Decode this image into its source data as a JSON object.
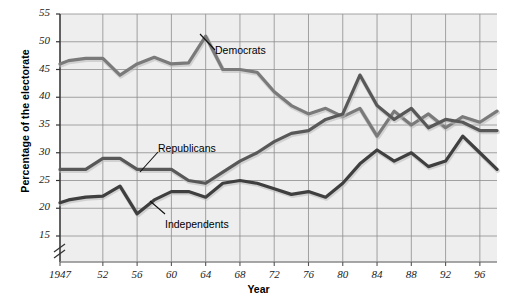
{
  "chart_data": {
    "type": "line",
    "title": "",
    "xlabel": "Year",
    "ylabel": "Percentage of the electorate",
    "xlim": [
      1947,
      1998
    ],
    "ylim": [
      13,
      55
    ],
    "axis_break": true,
    "grid": true,
    "legend_position": "inline-annotations",
    "ytick_labels": [
      "15",
      "20",
      "25",
      "30",
      "35",
      "40",
      "45",
      "50",
      "55"
    ],
    "ytick_values": [
      15,
      20,
      25,
      30,
      35,
      40,
      45,
      50,
      55
    ],
    "xtick_labels": [
      "1947",
      "52",
      "56",
      "60",
      "64",
      "68",
      "72",
      "76",
      "80",
      "84",
      "88",
      "92",
      "96"
    ],
    "xtick_values": [
      1947,
      1952,
      1956,
      1960,
      1964,
      1968,
      1972,
      1976,
      1980,
      1984,
      1988,
      1992,
      1996
    ],
    "x": [
      1947,
      1948,
      1950,
      1952,
      1954,
      1956,
      1958,
      1960,
      1962,
      1964,
      1966,
      1968,
      1970,
      1972,
      1974,
      1976,
      1978,
      1980,
      1982,
      1984,
      1986,
      1988,
      1990,
      1992,
      1994,
      1996,
      1998
    ],
    "series": [
      {
        "name": "Democrats",
        "color": "#7a7a7a",
        "values": [
          46.0,
          46.6,
          47.0,
          47.0,
          44.0,
          46.0,
          47.2,
          46.0,
          46.2,
          51.0,
          45.0,
          45.0,
          44.5,
          41.0,
          38.5,
          37.0,
          38.0,
          36.5,
          38.0,
          33.0,
          37.5,
          35.0,
          37.0,
          34.5,
          36.5,
          35.5,
          37.5
        ]
      },
      {
        "name": "Republicans",
        "color": "#585858",
        "values": [
          27.0,
          27.0,
          27.0,
          29.0,
          29.0,
          27.0,
          27.0,
          27.0,
          25.0,
          24.5,
          26.5,
          28.5,
          30.0,
          32.0,
          33.5,
          34.0,
          36.0,
          37.0,
          44.0,
          38.5,
          36.0,
          38.0,
          34.5,
          36.0,
          35.5,
          34.0,
          34.0
        ]
      },
      {
        "name": "Independents",
        "color": "#3f3f3f",
        "values": [
          21.0,
          21.5,
          22.0,
          22.2,
          24.0,
          19.0,
          21.5,
          23.0,
          23.0,
          22.0,
          24.5,
          25.0,
          24.5,
          23.5,
          22.5,
          23.0,
          22.0,
          24.5,
          28.0,
          30.5,
          28.5,
          30.0,
          27.5,
          28.5,
          33.0,
          30.0,
          27.0
        ]
      }
    ],
    "annotations": [
      {
        "label": "Democrats",
        "x_px": 215,
        "y_px": 44
      },
      {
        "label": "Republicans",
        "x_px": 158,
        "y_px": 142
      },
      {
        "label": "Independents",
        "x_px": 165,
        "y_px": 218
      }
    ]
  }
}
